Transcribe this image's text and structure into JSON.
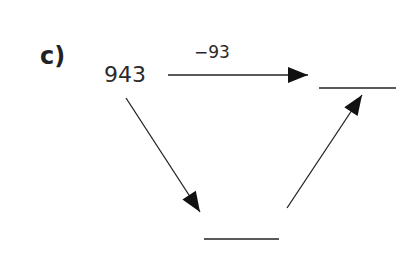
{
  "exercise": {
    "label": "c)",
    "start_value": "943",
    "operation": "−93",
    "blanks": [
      "top-right",
      "bottom"
    ]
  }
}
